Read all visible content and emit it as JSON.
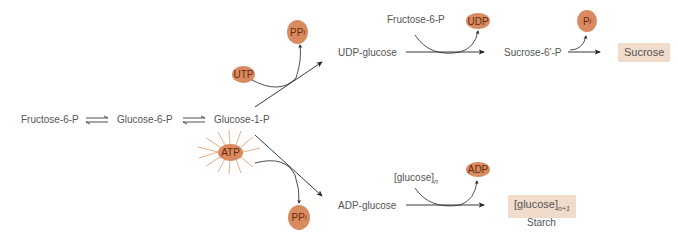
{
  "pathway": {
    "main": {
      "fructose6p": "Fructose-6-P",
      "glucose6p": "Glucose-6-P",
      "glucose1p": "Glucose-1-P"
    },
    "sucrose_branch": {
      "cofactor_in": "UTP",
      "cofactor_out_base": "PP",
      "cofactor_out_sub": "i",
      "intermediate": "UDP-glucose",
      "cosubstrate": "Fructose-6-P",
      "byproduct": "UDP",
      "intermediate2": "Sucrose-6′-P",
      "phosphate_base": "P",
      "phosphate_sub": "i",
      "product": "Sucrose"
    },
    "starch_branch": {
      "cofactor_in": "ATP",
      "cofactor_out_base": "PP",
      "cofactor_out_sub": "i",
      "intermediate": "ADP-glucose",
      "cosubstrate_base": "[glucose]",
      "cosubstrate_sub": "n",
      "byproduct": "ADP",
      "product_base": "[glucose]",
      "product_sub": "n+1",
      "product_name": "Starch"
    }
  },
  "colors": {
    "molecule_fill": "#d98a5e",
    "molecule_text": "#6a2a10",
    "product_box": "#f1dccc",
    "atp_rays": "#e8b08a",
    "lines": "#222222"
  }
}
